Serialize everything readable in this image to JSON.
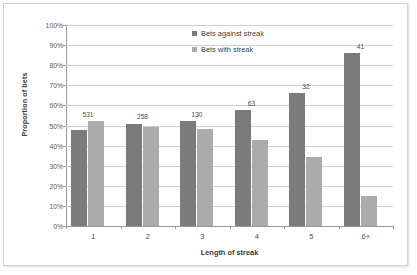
{
  "chart_data": {
    "type": "bar",
    "title": "",
    "xlabel": "Length of streak",
    "ylabel": "Proportion of bets",
    "categories": [
      "1",
      "2",
      "3",
      "4",
      "5",
      "6+"
    ],
    "ylim": [
      0,
      100
    ],
    "ytick_labels": [
      "0%",
      "10%",
      "20%",
      "30%",
      "40%",
      "50%",
      "60%",
      "70%",
      "80%",
      "90%",
      "100%"
    ],
    "ytick_values": [
      0,
      10,
      20,
      30,
      40,
      50,
      60,
      70,
      80,
      90,
      100
    ],
    "grid": true,
    "legend_position": "upper-center",
    "series": [
      {
        "name": "Bets against streak",
        "color": "#7b7b7b",
        "values": [
          48.0,
          51.0,
          52.0,
          57.5,
          66.0,
          86.0
        ]
      },
      {
        "name": "Bets with streak",
        "color": "#ababab",
        "values": [
          52.0,
          49.5,
          48.5,
          43.0,
          34.5,
          15.0
        ]
      }
    ],
    "annotations": [
      "531",
      "258",
      "130",
      "63",
      "32",
      "41"
    ]
  }
}
